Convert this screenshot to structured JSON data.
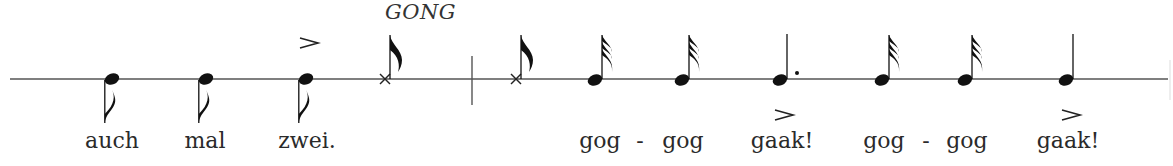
{
  "figure": {
    "type": "percussion-rhythm-notation",
    "staff": "single-line",
    "instrument_label": "GONG",
    "colors": {
      "ink": "#1a1a1a",
      "staff_line": "#555555",
      "background": "#ffffff"
    }
  },
  "notes": [
    {
      "index": 0,
      "kind": "eighth",
      "stem": "down",
      "head": "filled",
      "accent": "none",
      "lyric": "auch"
    },
    {
      "index": 1,
      "kind": "eighth",
      "stem": "down",
      "head": "filled",
      "accent": "none",
      "lyric": "mal"
    },
    {
      "index": 2,
      "kind": "eighth",
      "stem": "down",
      "head": "filled",
      "accent": "above",
      "lyric": "zwei."
    },
    {
      "index": 3,
      "kind": "eighth",
      "stem": "up",
      "head": "x",
      "accent": "none",
      "lyric": "",
      "label": "GONG"
    },
    {
      "index": 4,
      "kind": "barline"
    },
    {
      "index": 5,
      "kind": "eighth",
      "stem": "up",
      "head": "x",
      "accent": "none",
      "lyric": ""
    },
    {
      "index": 6,
      "kind": "thirty-second",
      "stem": "up",
      "head": "filled",
      "accent": "none",
      "lyric": "gog"
    },
    {
      "index": 7,
      "kind": "thirty-second",
      "stem": "up",
      "head": "filled",
      "accent": "none",
      "lyric": "gog"
    },
    {
      "index": 8,
      "kind": "dotted-quarter",
      "stem": "up",
      "head": "filled",
      "accent": "below",
      "lyric": "gaak!"
    },
    {
      "index": 9,
      "kind": "thirty-second",
      "stem": "up",
      "head": "filled",
      "accent": "none",
      "lyric": "gog"
    },
    {
      "index": 10,
      "kind": "thirty-second",
      "stem": "up",
      "head": "filled",
      "accent": "none",
      "lyric": "gog"
    },
    {
      "index": 11,
      "kind": "quarter",
      "stem": "up",
      "head": "filled",
      "accent": "below",
      "lyric": "gaak!"
    }
  ],
  "lyrics": {
    "auch": "auch",
    "mal": "mal",
    "zwei": "zwei.",
    "gog1": "gog",
    "hyphen1": "-",
    "gog2": "gog",
    "gaak1": "gaak!",
    "gog3": "gog",
    "hyphen2": "-",
    "gog4": "gog",
    "gaak2": "gaak!"
  },
  "labels": {
    "gong": "GONG"
  }
}
